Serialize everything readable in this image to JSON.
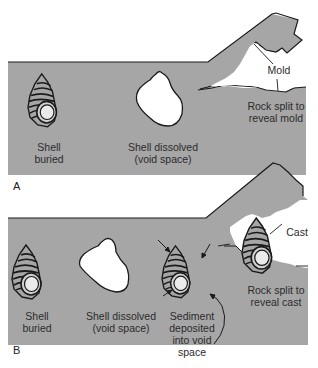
{
  "colors": {
    "rock": "#a6a6a6",
    "outline": "#1a1a1a",
    "void": "#ffffff",
    "aperture": "#e6e6e6",
    "text": "#2b2b2b"
  },
  "panel_a": {
    "letter": "A",
    "shell_buried": {
      "line1": "Shell",
      "line2": "buried"
    },
    "shell_dissolved": {
      "line1": "Shell dissolved",
      "line2": "(void space)"
    },
    "mold_label": "Mold",
    "rock_split": {
      "line1": "Rock split to",
      "line2": "reveal mold"
    }
  },
  "panel_b": {
    "letter": "B",
    "shell_buried": {
      "line1": "Shell",
      "line2": "buried"
    },
    "shell_dissolved": {
      "line1": "Shell dissolved",
      "line2": "(void space)"
    },
    "sediment": {
      "line1": "Sediment",
      "line2": "deposited",
      "line3": "into void",
      "line4": "space"
    },
    "cast_label": "Cast",
    "rock_split": {
      "line1": "Rock split to",
      "line2": "reveal cast"
    }
  }
}
